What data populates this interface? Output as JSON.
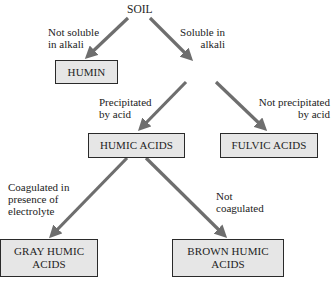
{
  "diagram": {
    "root": "SOIL",
    "nodes": {
      "humin": "HUMIN",
      "humic_acids": "HUMIC ACIDS",
      "fulvic_acids": "FULVIC ACIDS",
      "gray_humic_acids_line1": "GRAY HUMIC",
      "gray_humic_acids_line2": "ACIDS",
      "brown_humic_acids_line1": "BROWN HUMIC",
      "brown_humic_acids_line2": "ACIDS"
    },
    "edge_labels": {
      "not_soluble_line1": "Not soluble",
      "not_soluble_line2": "in alkali",
      "soluble_line1": "Soluble in",
      "soluble_line2": "alkali",
      "precipitated_line1": "Precipitated",
      "precipitated_line2": "by acid",
      "not_precipitated_line1": "Not precipitated",
      "not_precipitated_line2": "by acid",
      "coagulated_line1": "Coagulated in",
      "coagulated_line2": "presence of",
      "coagulated_line3": "electrolyte",
      "not_coagulated_line1": "Not",
      "not_coagulated_line2": "coagulated"
    },
    "edges": [
      {
        "from": "SOIL",
        "to": "HUMIN",
        "label": "Not soluble in alkali"
      },
      {
        "from": "SOIL",
        "to": "alkali-soluble fraction",
        "label": "Soluble in alkali"
      },
      {
        "from": "alkali-soluble fraction",
        "to": "HUMIC ACIDS",
        "label": "Precipitated by acid"
      },
      {
        "from": "alkali-soluble fraction",
        "to": "FULVIC ACIDS",
        "label": "Not precipitated by acid"
      },
      {
        "from": "HUMIC ACIDS",
        "to": "GRAY HUMIC ACIDS",
        "label": "Coagulated in presence of electrolyte"
      },
      {
        "from": "HUMIC ACIDS",
        "to": "BROWN HUMIC ACIDS",
        "label": "Not coagulated"
      }
    ],
    "colors": {
      "box_fill": "#e6e6e6",
      "box_border": "#2a2a2a",
      "arrow": "#6e6e6e"
    }
  }
}
